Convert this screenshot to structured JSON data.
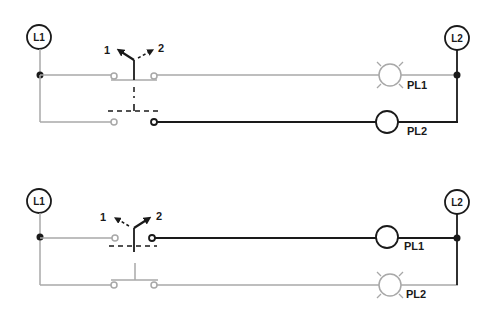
{
  "colors": {
    "energized": "#1a1a1a",
    "deenergized": "#a8a8a8",
    "background": "#ffffff"
  },
  "diagrams": [
    {
      "name": "position-1",
      "line1_label": "L1",
      "line2_label": "L2",
      "switch_positions": [
        "1",
        "2"
      ],
      "active_position": "1",
      "lamps": [
        {
          "label": "PL1",
          "state": "lit"
        },
        {
          "label": "PL2",
          "state": "off"
        }
      ]
    },
    {
      "name": "position-2",
      "line1_label": "L1",
      "line2_label": "L2",
      "switch_positions": [
        "1",
        "2"
      ],
      "active_position": "2",
      "lamps": [
        {
          "label": "PL1",
          "state": "off"
        },
        {
          "label": "PL2",
          "state": "lit"
        }
      ]
    }
  ]
}
